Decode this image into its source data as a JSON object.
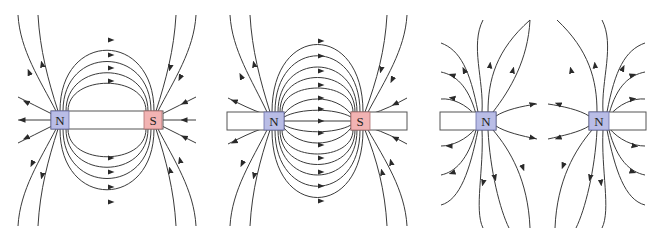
{
  "figure": {
    "panels": [
      {
        "id": "single-bar-magnet",
        "poles": [
          {
            "label": "N",
            "color": "#b9bde6"
          },
          {
            "label": "S",
            "color": "#f2b3b3"
          }
        ]
      },
      {
        "id": "opposite-poles-facing",
        "poles": [
          {
            "label": "N",
            "color": "#b9bde6"
          },
          {
            "label": "S",
            "color": "#f2b3b3"
          }
        ]
      },
      {
        "id": "like-poles-facing",
        "poles": [
          {
            "label": "N",
            "color": "#b9bde6"
          },
          {
            "label": "N",
            "color": "#b9bde6"
          }
        ]
      }
    ],
    "colors": {
      "north_pole": "#b9bde6",
      "south_pole": "#f2b3b3",
      "field_line": "#3a3a3a"
    }
  }
}
